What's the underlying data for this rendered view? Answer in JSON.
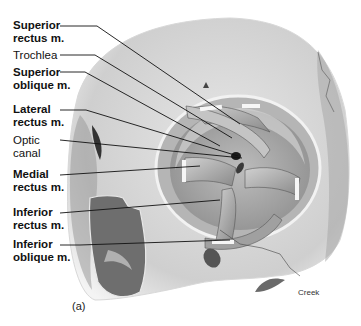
{
  "figure": {
    "panel_label": "(a)",
    "credit": "Creek",
    "labels": [
      {
        "id": "superior-rectus",
        "line1": "Superior",
        "line2": "rectus m.",
        "bold": true
      },
      {
        "id": "trochlea",
        "line1": "Trochlea",
        "line2": "",
        "bold": false
      },
      {
        "id": "superior-oblique",
        "line1": "Superior",
        "line2": "oblique m.",
        "bold": true
      },
      {
        "id": "lateral-rectus",
        "line1": "Lateral",
        "line2": "rectus m.",
        "bold": true
      },
      {
        "id": "optic-canal",
        "line1": "Optic",
        "line2": "canal",
        "bold": false
      },
      {
        "id": "medial-rectus",
        "line1": "Medial",
        "line2": "rectus m.",
        "bold": true
      },
      {
        "id": "inferior-rectus",
        "line1": "Inferior",
        "line2": "rectus m.",
        "bold": true
      },
      {
        "id": "inferior-oblique",
        "line1": "Inferior",
        "line2": "oblique m.",
        "bold": true
      }
    ]
  }
}
